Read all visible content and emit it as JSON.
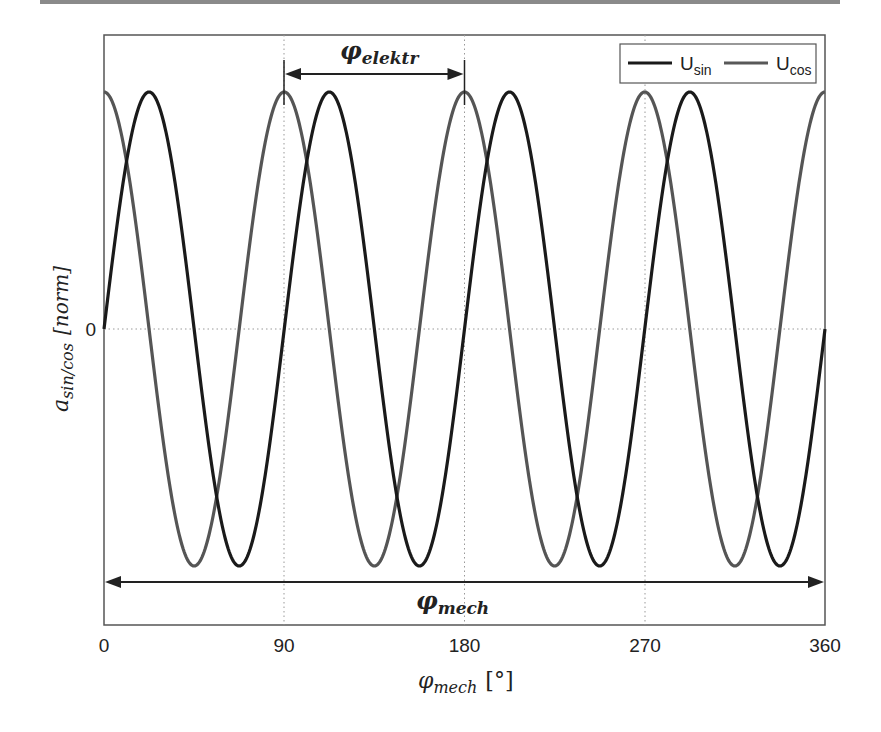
{
  "chart_data": {
    "type": "line",
    "title": "",
    "xlabel": "φ_mech [°]",
    "ylabel": "a_sin/cos [norm]",
    "xlim": [
      0,
      360
    ],
    "ylim": [
      -1.18,
      1.18
    ],
    "xticks": [
      0,
      90,
      180,
      270,
      360
    ],
    "yticks": [
      0
    ],
    "xtick_labels": [
      "0",
      "90",
      "180",
      "270",
      "360"
    ],
    "ytick_labels": [
      "0"
    ],
    "grid": {
      "x": true,
      "y": true,
      "style": "dotted"
    },
    "legend_position": "upper right",
    "periods": 4,
    "series": [
      {
        "name": "U_sin",
        "function": "sin(4·φ_mech)",
        "amplitude": 1,
        "color": "#1a1a1a"
      },
      {
        "name": "U_cos",
        "function": "cos(4·φ_mech)",
        "amplitude": 1,
        "color": "#555555"
      }
    ],
    "annotations": [
      {
        "label": "φ_elektr",
        "type": "double-arrow",
        "x_from": 90,
        "x_to": 180
      },
      {
        "label": "φ_mech",
        "type": "double-arrow",
        "x_from": 0,
        "x_to": 360
      }
    ]
  },
  "labels": {
    "x_axis_main": "φ",
    "x_axis_sub": "mech",
    "x_axis_unit": "[°]",
    "y_axis_main": "a",
    "y_axis_sub": "sin/cos",
    "y_axis_unit": "[norm]",
    "elektr_main": "φ",
    "elektr_sub": "elektr",
    "mech_main": "φ",
    "mech_sub": "mech",
    "legend_sin_main": "U",
    "legend_sin_sub": "sin",
    "legend_cos_main": "U",
    "legend_cos_sub": "cos",
    "xtick0": "0",
    "xtick90": "90",
    "xtick180": "180",
    "xtick270": "270",
    "xtick360": "360",
    "ytick0": "0"
  }
}
